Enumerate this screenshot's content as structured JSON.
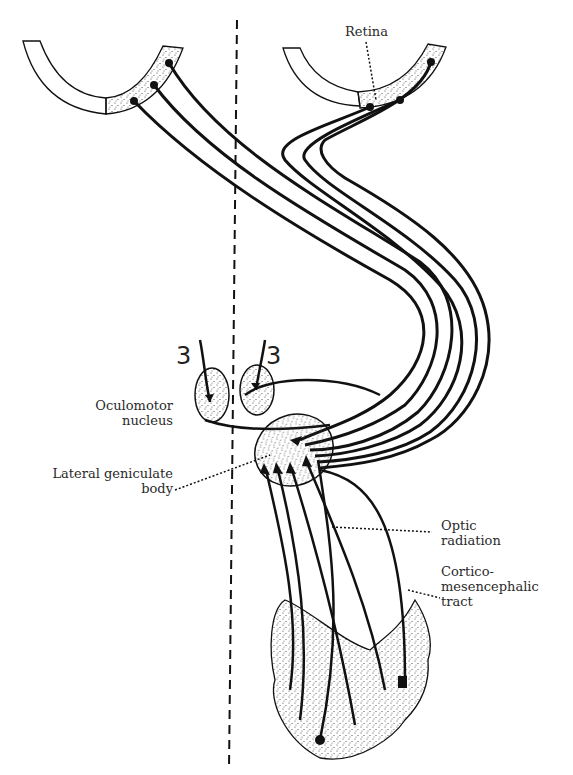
{
  "diagram": {
    "type": "anatomical-pathway",
    "labels": {
      "retina": "Retina",
      "oculomotor_line1": "Oculomotor",
      "oculomotor_line2": "nucleus",
      "lgb_line1": "Lateral geniculate",
      "lgb_line2": "body",
      "optic_line1": "Optic",
      "optic_line2": "radiation",
      "cortico_line1": "Cortico-",
      "cortico_line2": "mesencephalic",
      "cortico_line3": "tract",
      "nerve_left": "3",
      "nerve_right": "3"
    },
    "colors": {
      "ink": "#111111",
      "background": "#ffffff",
      "stipple": "#555555"
    }
  }
}
